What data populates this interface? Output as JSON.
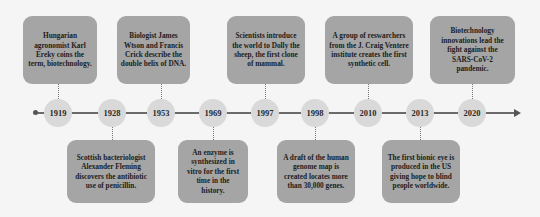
{
  "colors": {
    "background": "#f5f5f5",
    "box_fill": "#a5a5a5",
    "node_fill": "#d9d9d9",
    "axis": "#6b6b6b",
    "text": "#1c1c1c"
  },
  "timeline": {
    "years": [
      "1919",
      "1928",
      "1953",
      "1969",
      "1997",
      "1998",
      "2010",
      "2013",
      "2020"
    ]
  },
  "events": [
    {
      "year": "1919",
      "position": "top",
      "text": "Hungarian agronomist Karl Ereky coins the term, biotechnology."
    },
    {
      "year": "1928",
      "position": "bottom",
      "text": "Scottish bacteriologist Alexander Fleming discovers the antibiotic use of penicillin."
    },
    {
      "year": "1953",
      "position": "top",
      "text": "Biologist James Wtson and Francis Crick describe the double helix of DNA."
    },
    {
      "year": "1969",
      "position": "bottom",
      "text": "An enzyme is synthesized in vitro for the first time in the history."
    },
    {
      "year": "1997",
      "position": "top",
      "text": "Scientists introduce the world to Dolly the sheep, the first clone of mammal."
    },
    {
      "year": "1998",
      "position": "bottom",
      "text": "A draft of the human genome map is created locates more than 30,000 genes."
    },
    {
      "year": "2010",
      "position": "top",
      "text": "A group of reswarchers from the J. Craig Ventere institute creates the first synthetic cell."
    },
    {
      "year": "2013",
      "position": "bottom",
      "text": "The first bionic eye is produced in the US giving hope to blind people worldwide."
    },
    {
      "year": "2020",
      "position": "top",
      "text": "Biotechnology innovations lead the fight against the SARS-CoV-2 pandemic."
    }
  ]
}
